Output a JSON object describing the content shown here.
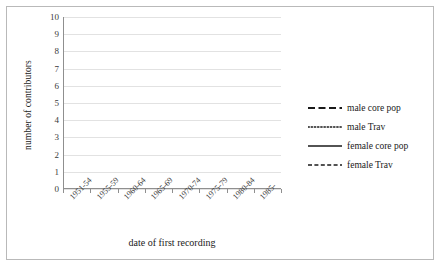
{
  "chart_data": {
    "type": "line",
    "title": "",
    "xlabel": "date of first recording",
    "ylabel": "number of contributors",
    "categories": [
      "1951-54",
      "1955-59",
      "1960-64",
      "1965-69",
      "1970-74",
      "1975-79",
      "1980-84",
      "1985-"
    ],
    "ylim": [
      0,
      10
    ],
    "yticks": [
      0,
      1,
      2,
      3,
      4,
      5,
      6,
      7,
      8,
      9,
      10
    ],
    "grid": true,
    "legend_position": "right",
    "series": [
      {
        "name": "male core pop",
        "style": "long-dash",
        "color": "#1a1a1a",
        "values": [
          9,
          4,
          5,
          2,
          2,
          1,
          0,
          0
        ]
      },
      {
        "name": "male Trav",
        "style": "dotted",
        "color": "#1a1a1a",
        "values": [
          6,
          2,
          0,
          1,
          1,
          1,
          0,
          0
        ]
      },
      {
        "name": "female core pop",
        "style": "solid",
        "color": "#1a1a1a",
        "values": [
          1,
          2,
          5,
          1,
          0,
          1,
          0,
          1
        ]
      },
      {
        "name": "female Trav",
        "style": "short-dash",
        "color": "#1a1a1a",
        "values": [
          8,
          3,
          3,
          0,
          2,
          1,
          1,
          0
        ]
      }
    ]
  },
  "legend": {
    "items": [
      {
        "label": "male core pop"
      },
      {
        "label": "male Trav"
      },
      {
        "label": "female core pop"
      },
      {
        "label": "female Trav"
      }
    ]
  }
}
